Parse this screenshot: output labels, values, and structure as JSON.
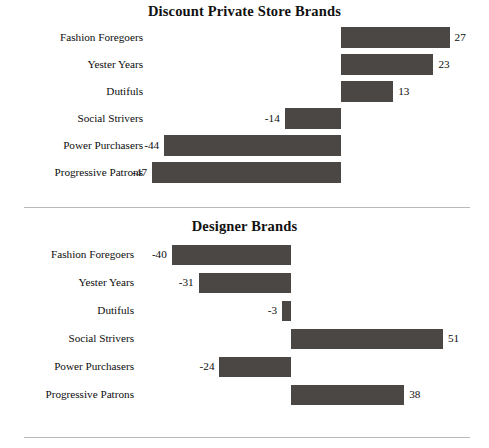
{
  "page": {
    "background": "#ffffff",
    "bar_color": "#4a4745",
    "text_color": "#0d0d0d",
    "separator_color": "#b9b9b9"
  },
  "chart_data": [
    {
      "type": "bar",
      "orientation": "horizontal",
      "title": "Discount Private Store Brands",
      "xlabel": "",
      "ylabel": "",
      "grid": false,
      "legend": "none",
      "zero_line": true,
      "xlim": [
        -47,
        27
      ],
      "categories": [
        "Fashion Foregoers",
        "Yester Years",
        "Dutifuls",
        "Social Strivers",
        "Power Purchasers",
        "Progressive Patrons"
      ],
      "values": [
        27,
        23,
        13,
        -14,
        -44,
        -47
      ],
      "labels": [
        "27",
        "23",
        "13",
        "-14",
        "-44",
        "-47"
      ]
    },
    {
      "type": "bar",
      "orientation": "horizontal",
      "title": "Designer Brands",
      "xlabel": "",
      "ylabel": "",
      "grid": false,
      "legend": "none",
      "zero_line": true,
      "xlim": [
        -40,
        51
      ],
      "categories": [
        "Fashion Foregoers",
        "Yester Years",
        "Dutifuls",
        "Social Strivers",
        "Power Purchasers",
        "Progressive Patrons"
      ],
      "values": [
        -40,
        -31,
        -3,
        51,
        -24,
        38
      ],
      "labels": [
        "-40",
        "-31",
        "-3",
        "51",
        "-24",
        "38"
      ]
    }
  ]
}
